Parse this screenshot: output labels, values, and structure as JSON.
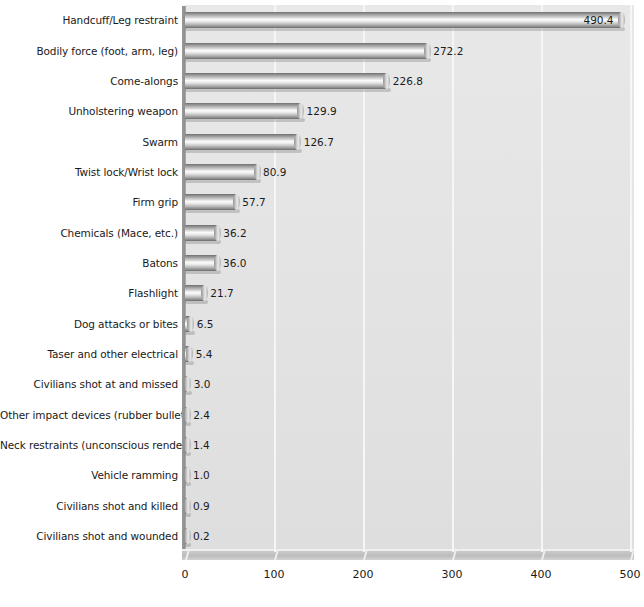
{
  "chart_data": {
    "type": "bar",
    "orientation": "horizontal",
    "title": "",
    "subtitle": "",
    "xlabel": "",
    "ylabel": "",
    "xlim": [
      0,
      500
    ],
    "xticks": [
      0,
      100,
      200,
      300,
      400,
      500
    ],
    "xtick_labels": [
      "0",
      "100",
      "200",
      "300",
      "400",
      "500"
    ],
    "grid": true,
    "legend": "none",
    "style": "3d-cylinder-bars",
    "categories": [
      "Handcuff/Leg restraint",
      "Bodily force (foot, arm, leg)",
      "Come-alongs",
      "Unholstering weapon",
      "Swarm",
      "Twist lock/Wrist lock",
      "Firm grip",
      "Chemicals (Mace, etc.)",
      "Batons",
      "Flashlight",
      "Dog attacks or bites",
      "Taser and other electrical",
      "Civilians shot at and missed",
      "Other impact devices (rubber bullets)",
      "Neck restraints (unconscious rendering)",
      "Vehicle ramming",
      "Civilians shot and killed",
      "Civilians shot and wounded"
    ],
    "values": [
      490.4,
      272.2,
      226.8,
      129.9,
      126.7,
      80.9,
      57.7,
      36.2,
      36.0,
      21.7,
      6.5,
      5.4,
      3.0,
      2.4,
      1.4,
      1.0,
      0.9,
      0.2
    ],
    "value_labels": [
      "490.4",
      "272.2",
      "226.8",
      "129.9",
      "126.7",
      "80.9",
      "57.7",
      "36.2",
      "36.0",
      "21.7",
      "6.5",
      "5.4",
      "3.0",
      "2.4",
      "1.4",
      "1.0",
      "0.9",
      "0.2"
    ],
    "label_placement": [
      "inside-end",
      "outside-end",
      "outside-end",
      "outside-end",
      "outside-end",
      "outside-end",
      "outside-end",
      "outside-end",
      "outside-end",
      "outside-end",
      "outside-end",
      "outside-end",
      "outside-end",
      "outside-end",
      "outside-end",
      "outside-end",
      "outside-end",
      "outside-end"
    ]
  },
  "colors": {
    "plot_background": "#e3e3e3",
    "page_background": "#ffffff",
    "gridline": "#f6f6f6",
    "bar_highlight": "#fbfbfb",
    "bar_shade": "#6f6f6f",
    "text": "#1a1a1a"
  }
}
